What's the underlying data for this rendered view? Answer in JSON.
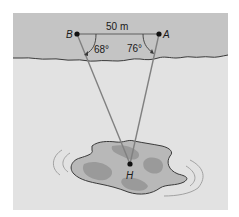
{
  "diagram": {
    "type": "triangulation-diagram",
    "points": {
      "A": {
        "label": "A"
      },
      "B": {
        "label": "B"
      },
      "H": {
        "label": "H"
      }
    },
    "distance_label": "50 m",
    "angle_B": "68°",
    "angle_A": "76°",
    "regions": [
      "shore",
      "water",
      "island"
    ],
    "colors": {
      "shore": "#c4c4c4",
      "water": "#e2e2e2",
      "island_light": "#b8b8b8",
      "island_dark": "#9a9a9a",
      "lines": "#808080",
      "outline": "#3a3a3a"
    }
  }
}
